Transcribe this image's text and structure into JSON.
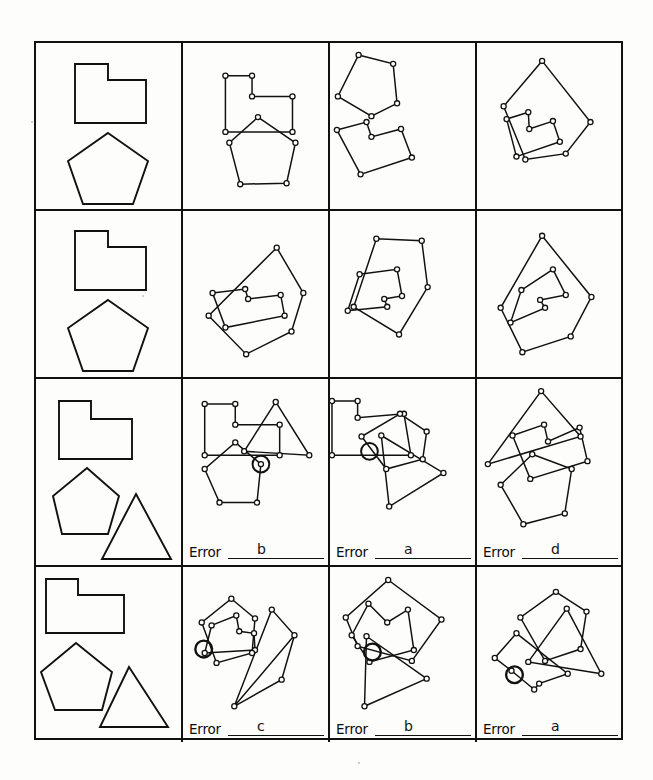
{
  "document": {
    "title": "Shape copying / constructional praxis test sheet",
    "background_color": "#fdfdfb",
    "ink_color": "#111111",
    "grid": {
      "rows": 4,
      "columns": 4
    }
  },
  "legend": {
    "column1_role": "reference-stimulus",
    "columns2to4_role": "participant-drawing",
    "vertex_marker": "small open circle",
    "error_marker": "large circle drawn around a vertex"
  },
  "error_label": {
    "text": "Error",
    "line": "____________"
  },
  "rows": [
    {
      "id": "row-1",
      "reference_shapes": [
        "l-shape",
        "pentagon"
      ],
      "has_error_labels": false,
      "cells": [
        {
          "id": "r1c1",
          "type": "reference",
          "shapes": [
            "l-shape",
            "pentagon"
          ],
          "error": null
        },
        {
          "id": "r1c2",
          "type": "drawing",
          "error": null,
          "error_marked": false
        },
        {
          "id": "r1c3",
          "type": "drawing",
          "error": null,
          "error_marked": false
        },
        {
          "id": "r1c4",
          "type": "drawing",
          "error": null,
          "error_marked": false
        }
      ]
    },
    {
      "id": "row-2",
      "reference_shapes": [
        "l-shape",
        "pentagon"
      ],
      "has_error_labels": false,
      "cells": [
        {
          "id": "r2c1",
          "type": "reference",
          "shapes": [
            "l-shape",
            "pentagon"
          ],
          "error": null
        },
        {
          "id": "r2c2",
          "type": "drawing",
          "error": null,
          "error_marked": false
        },
        {
          "id": "r2c3",
          "type": "drawing",
          "error": null,
          "error_marked": false
        },
        {
          "id": "r2c4",
          "type": "drawing",
          "error": null,
          "error_marked": false
        }
      ]
    },
    {
      "id": "row-3",
      "reference_shapes": [
        "l-shape",
        "pentagon",
        "triangle"
      ],
      "has_error_labels": true,
      "cells": [
        {
          "id": "r3c1",
          "type": "reference",
          "shapes": [
            "l-shape",
            "pentagon",
            "triangle"
          ],
          "error": null
        },
        {
          "id": "r3c2",
          "type": "drawing",
          "error": "b",
          "error_marked": true
        },
        {
          "id": "r3c3",
          "type": "drawing",
          "error": "a",
          "error_marked": true
        },
        {
          "id": "r3c4",
          "type": "drawing",
          "error": "d",
          "error_marked": false
        }
      ]
    },
    {
      "id": "row-4",
      "reference_shapes": [
        "l-shape",
        "pentagon",
        "triangle"
      ],
      "has_error_labels": true,
      "cells": [
        {
          "id": "r4c1",
          "type": "reference",
          "shapes": [
            "l-shape",
            "pentagon",
            "triangle"
          ],
          "error": null
        },
        {
          "id": "r4c2",
          "type": "drawing",
          "error": "c",
          "error_marked": true
        },
        {
          "id": "r4c3",
          "type": "drawing",
          "error": "b",
          "error_marked": true
        },
        {
          "id": "r4c4",
          "type": "drawing",
          "error": "a",
          "error_marked": true
        }
      ]
    }
  ]
}
